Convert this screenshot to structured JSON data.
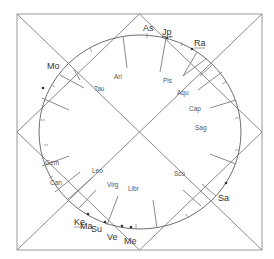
{
  "chart": {
    "style": "north-indian-diamond",
    "colors": {
      "frame": "#9a9a9a",
      "lines": "#8a8a8a",
      "circle": "#6e6e6e",
      "sign_text": "#555555",
      "planet_text": "#333333"
    },
    "signs": [
      {
        "label": "Ari",
        "x": 114,
        "y": 79
      },
      {
        "label": "Pis",
        "x": 163,
        "y": 83
      },
      {
        "label": "Aqu",
        "x": 177,
        "y": 95
      },
      {
        "label": "Cap",
        "x": 189,
        "y": 111
      },
      {
        "label": "Sag",
        "x": 195,
        "y": 130
      },
      {
        "label": "Tau",
        "x": 94,
        "y": 91
      },
      {
        "label": "Gem",
        "x": 45,
        "y": 165
      },
      {
        "label": "Can",
        "x": 50,
        "y": 185
      },
      {
        "label": "Leo",
        "x": 92,
        "y": 173
      },
      {
        "label": "Virg",
        "x": 107,
        "y": 187
      },
      {
        "label": "Libr",
        "x": 128,
        "y": 191
      },
      {
        "label": "Sco",
        "x": 174,
        "y": 176
      }
    ],
    "planets": [
      {
        "label": "As",
        "x": 143,
        "y": 31,
        "underline": false
      },
      {
        "label": "Jp",
        "x": 162,
        "y": 35,
        "underline": true
      },
      {
        "label": "Ra",
        "x": 194,
        "y": 46,
        "underline": true
      },
      {
        "label": "Mo",
        "x": 47,
        "y": 69,
        "underline": false
      },
      {
        "label": "Sa",
        "x": 218,
        "y": 201,
        "underline": false
      },
      {
        "label": "Ke",
        "x": 74,
        "y": 225,
        "underline": true
      },
      {
        "label": "Ma",
        "x": 80,
        "y": 229,
        "underline": false
      },
      {
        "label": "Su",
        "x": 91,
        "y": 232,
        "underline": false
      },
      {
        "label": "Ve",
        "x": 107,
        "y": 240,
        "underline": false
      },
      {
        "label": "Me",
        "x": 124,
        "y": 244,
        "underline": false
      }
    ]
  }
}
